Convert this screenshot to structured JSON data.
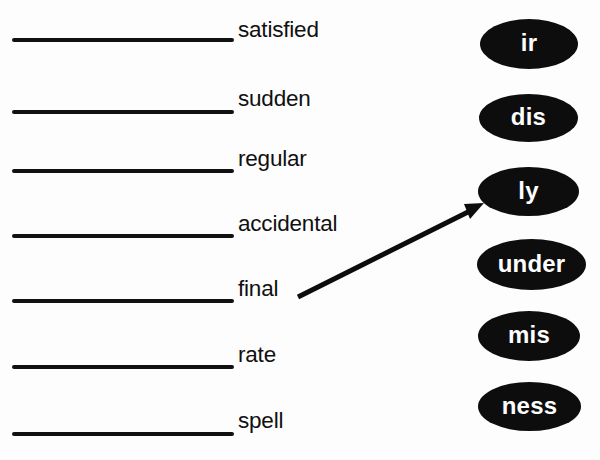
{
  "worksheet": {
    "background_color": "#fdfdfd",
    "ink_color": "#101010",
    "token_fill_color": "#0d0d0d",
    "token_text_color": "#ffffff"
  },
  "base_words": [
    {
      "label": "satisfied",
      "line_y": 38,
      "text_top": 19
    },
    {
      "label": "sudden",
      "line_y": 110,
      "text_top": 88
    },
    {
      "label": "regular",
      "line_y": 169,
      "text_top": 148
    },
    {
      "label": "accidental",
      "line_y": 234,
      "text_top": 213
    },
    {
      "label": "final",
      "line_y": 299,
      "text_top": 278
    },
    {
      "label": "rate",
      "line_y": 365,
      "text_top": 344
    },
    {
      "label": "spell",
      "line_y": 432,
      "text_top": 410
    }
  ],
  "affixes": [
    {
      "label": "ir",
      "x": 480,
      "y": 19,
      "w": 98,
      "h": 50
    },
    {
      "label": "dis",
      "x": 479,
      "y": 94,
      "w": 99,
      "h": 48
    },
    {
      "label": "ly",
      "x": 478,
      "y": 167,
      "w": 101,
      "h": 49
    },
    {
      "label": "under",
      "x": 477,
      "y": 239,
      "w": 109,
      "h": 51
    },
    {
      "label": "mis",
      "x": 478,
      "y": 311,
      "w": 102,
      "h": 50
    },
    {
      "label": "ness",
      "x": 478,
      "y": 382,
      "w": 103,
      "h": 49
    }
  ],
  "connector_arrow": {
    "from_word": "final",
    "to_affix": "ly",
    "tail_x": 298,
    "tail_y": 297,
    "tip_x": 484,
    "tip_y": 203,
    "stroke_color": "#0d0d0d",
    "stroke_width": 5
  }
}
